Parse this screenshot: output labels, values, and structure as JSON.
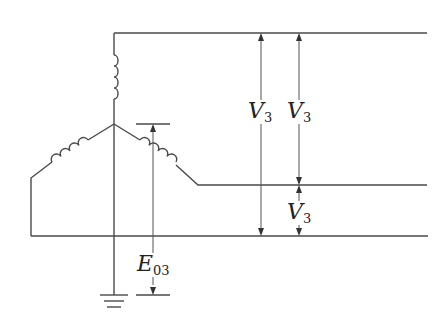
{
  "diagram": {
    "type": "three-phase star connection with grounded neutral",
    "colors": {
      "wire": "#4a4a4a",
      "background": "#ffffff"
    },
    "labels": {
      "v_top_left": {
        "symbol": "V",
        "subscript": "3"
      },
      "v_top_right": {
        "symbol": "V",
        "subscript": "3"
      },
      "v_bottom": {
        "symbol": "V",
        "subscript": "3"
      },
      "e_neutral": {
        "symbol": "E",
        "subscript": "03"
      }
    }
  }
}
